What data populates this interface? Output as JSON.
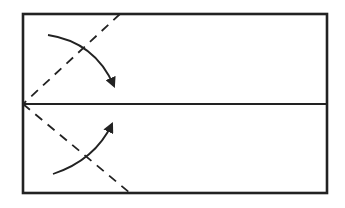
{
  "diagram": {
    "type": "origami-fold-instruction",
    "stroke_color": "#222222",
    "background_color": "#ffffff",
    "paper": {
      "x": 23,
      "y": 14,
      "width": 304,
      "height": 179
    },
    "center_crease": {
      "x1": 23,
      "y1": 104,
      "x2": 327,
      "y2": 104
    },
    "fold_lines": [
      {
        "name": "upper-diagonal",
        "style": "dashed",
        "x1": 120,
        "y1": 14,
        "x2": 23,
        "y2": 104
      },
      {
        "name": "lower-diagonal",
        "style": "dashed",
        "x1": 23,
        "y1": 104,
        "x2": 130,
        "y2": 193
      }
    ],
    "arrows": [
      {
        "name": "fold-top-corner-down",
        "from": [
          48,
          35
        ],
        "to": [
          115,
          88
        ]
      },
      {
        "name": "fold-bottom-corner-up",
        "from": [
          53,
          174
        ],
        "to": [
          113,
          122
        ]
      }
    ]
  }
}
